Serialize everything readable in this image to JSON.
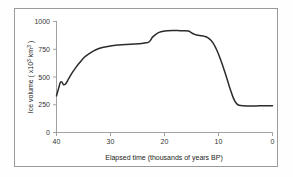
{
  "chart_data": {
    "type": "line",
    "title": "",
    "xlabel": "Elapsed time (thousands of years BP)",
    "ylabel": "Ice volume ( x10³ km³ )",
    "ylabel_parts": {
      "prefix": "Ice volume ( x10",
      "exp1": "3",
      "mid": " km",
      "exp2": "3",
      "suffix": " )"
    },
    "xlim": [
      40,
      0
    ],
    "ylim": [
      0,
      1000
    ],
    "x_reversed": true,
    "grid": false,
    "legend": "none",
    "xticks": [
      "40",
      "30",
      "20",
      "10",
      "0"
    ],
    "xtick_values": [
      40,
      30,
      20,
      10,
      0
    ],
    "yticks": [
      "0",
      "250",
      "500",
      "750",
      "1000"
    ],
    "ytick_values": [
      0,
      250,
      500,
      750,
      1000
    ],
    "series": [
      {
        "name": "Ice volume",
        "color": "#2b2b2b",
        "x": [
          40.0,
          39.6,
          39.3,
          39.0,
          38.7,
          38.3,
          37.8,
          37.2,
          36.5,
          35.7,
          34.8,
          33.8,
          32.7,
          31.5,
          30.0,
          28.5,
          27.0,
          25.5,
          24.2,
          23.5,
          23.0,
          22.6,
          22.2,
          21.6,
          21.0,
          20.2,
          19.4,
          18.5,
          17.5,
          16.5,
          15.6,
          15.2,
          14.8,
          14.3,
          13.8,
          13.2,
          12.6,
          12.0,
          11.4,
          10.8,
          10.2,
          9.6,
          9.0,
          8.4,
          7.9,
          7.4,
          7.0,
          6.6,
          6.2,
          5.5,
          4.5,
          3.5,
          2.5,
          1.5,
          0.5,
          0.0
        ],
        "y": [
          330,
          400,
          450,
          455,
          430,
          440,
          480,
          530,
          580,
          630,
          680,
          715,
          745,
          765,
          780,
          788,
          793,
          797,
          802,
          808,
          812,
          830,
          860,
          885,
          902,
          912,
          916,
          918,
          918,
          917,
          915,
          905,
          892,
          882,
          876,
          872,
          866,
          855,
          830,
          790,
          730,
          655,
          570,
          480,
          400,
          330,
          285,
          258,
          245,
          240,
          239,
          239,
          240,
          240,
          241,
          241
        ]
      }
    ]
  },
  "axes": {
    "x_axis_name": "elapsed-time-axis",
    "y_axis_name": "ice-volume-axis"
  }
}
